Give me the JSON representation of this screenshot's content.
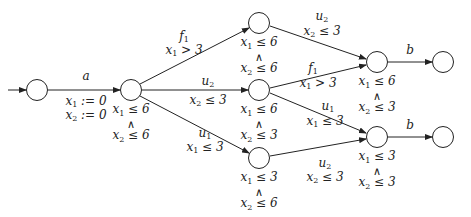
{
  "diagram": {
    "type": "timed-automaton",
    "states": [
      {
        "id": "s0",
        "cx": 37,
        "cy": 90,
        "initial": true,
        "invariant": null
      },
      {
        "id": "s1",
        "cx": 131,
        "cy": 90,
        "invariant": {
          "c1": "x1 ≤ 6",
          "op": "∧",
          "c2": "x2 ≤ 6"
        }
      },
      {
        "id": "s2",
        "cx": 259,
        "cy": 23,
        "invariant": {
          "c1": "x1 ≤ 6",
          "op": "∧",
          "c2": "x2 ≤ 6"
        }
      },
      {
        "id": "s3",
        "cx": 259,
        "cy": 90,
        "invariant": {
          "c1": "x1 ≤ 6",
          "op": "∧",
          "c2": "x2 ≤ 3"
        }
      },
      {
        "id": "s4",
        "cx": 259,
        "cy": 158,
        "invariant": {
          "c1": "x1 ≤ 3",
          "op": "∧",
          "c2": "x2 ≤ 6"
        }
      },
      {
        "id": "s5",
        "cx": 377,
        "cy": 62,
        "invariant": {
          "c1": "x1 ≤ 6",
          "op": "∧",
          "c2": "x2 ≤ 3"
        }
      },
      {
        "id": "s6",
        "cx": 443,
        "cy": 62,
        "invariant": null
      },
      {
        "id": "s7",
        "cx": 377,
        "cy": 137,
        "invariant": {
          "c1": "x1 ≤ 3",
          "op": "∧",
          "c2": "x2 ≤ 3"
        }
      },
      {
        "id": "s8",
        "cx": 443,
        "cy": 137,
        "invariant": null
      }
    ],
    "transitions": [
      {
        "from": "s0",
        "to": "s1",
        "action": "a",
        "guard": "",
        "resets": [
          "x1 := 0",
          "x2 := 0"
        ]
      },
      {
        "from": "s1",
        "to": "s2",
        "action": "f1",
        "guard": "x1 > 3"
      },
      {
        "from": "s1",
        "to": "s3",
        "action": "u2",
        "guard": "x2 ≤ 3"
      },
      {
        "from": "s1",
        "to": "s4",
        "action": "u1",
        "guard": "x1 ≤ 3"
      },
      {
        "from": "s2",
        "to": "s5",
        "action": "u2",
        "guard": "x2 ≤ 3"
      },
      {
        "from": "s3",
        "to": "s5",
        "action": "f1",
        "guard": "x1 > 3"
      },
      {
        "from": "s3",
        "to": "s7",
        "action": "u1",
        "guard": "x1 ≤ 3"
      },
      {
        "from": "s4",
        "to": "s7",
        "action": "u2",
        "guard": "x2 ≤ 3"
      },
      {
        "from": "s5",
        "to": "s6",
        "action": "b",
        "guard": ""
      },
      {
        "from": "s7",
        "to": "s8",
        "action": "b",
        "guard": ""
      }
    ]
  },
  "labels": {
    "a": "a",
    "f": "f",
    "u": "u",
    "b": "b",
    "x": "x",
    "one": "1",
    "two": "2",
    "assign_zero": " := 0",
    "le6": " ≤ 6",
    "le3": " ≤ 3",
    "gt3": " > 3",
    "and": "∧"
  }
}
